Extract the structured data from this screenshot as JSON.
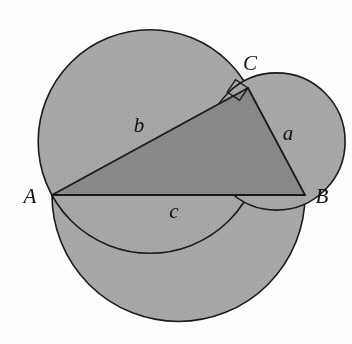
{
  "figure": {
    "background_color": "#fdfdfd",
    "stroke_color": "#1a1a1a",
    "circle_fill": "#a8a8a8",
    "triangle_fill": "#8a8a8a",
    "overlap_fill": "#8a8a8a",
    "stroke_width": 1.6
  },
  "vertices": {
    "A": {
      "label": "A",
      "x": 52,
      "y": 195,
      "label_x": 30,
      "label_y": 203
    },
    "B": {
      "label": "B",
      "x": 305,
      "y": 195,
      "label_x": 322,
      "label_y": 203
    },
    "C": {
      "label": "C",
      "x": 248,
      "y": 88,
      "label_x": 250,
      "label_y": 70
    }
  },
  "sides": [
    {
      "name": "a",
      "label": "a",
      "from": "C",
      "to": "B",
      "label_x": 288,
      "label_y": 140
    },
    {
      "name": "b",
      "label": "b",
      "from": "A",
      "to": "C",
      "label_x": 139,
      "label_y": 132
    },
    {
      "name": "c",
      "label": "c",
      "from": "A",
      "to": "B",
      "label_x": 174,
      "label_y": 218
    }
  ],
  "circles": [
    {
      "name": "circle-on-a",
      "side": "a",
      "cx": 276.5,
      "cy": 141.5,
      "r": 68.6
    },
    {
      "name": "circle-on-b",
      "side": "b",
      "cx": 150,
      "cy": 141.5,
      "r": 111.8
    },
    {
      "name": "circle-on-c",
      "side": "c",
      "cx": 178.5,
      "cy": 195,
      "r": 126.5
    }
  ],
  "right_angle_marker": {
    "name": "right-angle-at-C",
    "vertex": "C",
    "size": 15,
    "points": "248,88 235.6,79.6 227.2,92 239.6,100.4"
  }
}
